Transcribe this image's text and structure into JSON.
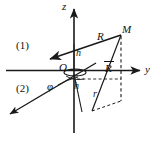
{
  "figure": {
    "kind": "geometry-diagram",
    "width": 157,
    "height": 141,
    "line_color": "#1a1a1a",
    "background": "#ffffff"
  },
  "axes": {
    "z": {
      "label": "z",
      "x": 64,
      "y": 3
    },
    "y": {
      "label": "y",
      "x": 146,
      "y": 70
    },
    "origin": {
      "label": "O",
      "x": 60,
      "y": 65
    }
  },
  "labels": {
    "region_one": {
      "text": "(1)",
      "x": 17,
      "y": 41
    },
    "region_two": {
      "text": "(2)",
      "x": 17,
      "y": 84
    },
    "vector_R_upper": {
      "text": "R",
      "x": 99,
      "y": 35
    },
    "point_M": {
      "text": "M",
      "x": 124,
      "y": 28
    },
    "vector_R_bar": {
      "text": "R",
      "x": 107,
      "y": 62,
      "overbar": true
    },
    "height_h_upper": {
      "text": "h",
      "x": 77,
      "y": 52
    },
    "height_h_lower": {
      "text": "h",
      "x": 75,
      "y": 85
    },
    "radius_r": {
      "text": "r",
      "x": 94,
      "y": 93
    },
    "angle_phi": {
      "text": "φ",
      "x": 48,
      "y": 84
    }
  },
  "geometry_notes": {
    "z_axis": "vertical line from top arrow at (74,8) down to (74,133)",
    "y_axis": "horizontal line from (8,70) right to arrow at (142,70)",
    "x_axis": "oblique line from upper-right near origin down-left to arrow at (7,116)",
    "R_upper_vector": "arrow from point M (120,34) to lower-left tip at (48,60)",
    "R_bar_vector": "line from foot of projection (92,110) up to M (120,34)",
    "projection_drop": "dashed vertical line from M (120,34) down to (120,100)",
    "radius_r_segment": "dashed line from (92,110) to (120,100)",
    "phi_arc": "small arc at origin between x-axis and projection direction",
    "origin_ellipse": "small flattened ellipse around origin marking the azimuth angle"
  }
}
